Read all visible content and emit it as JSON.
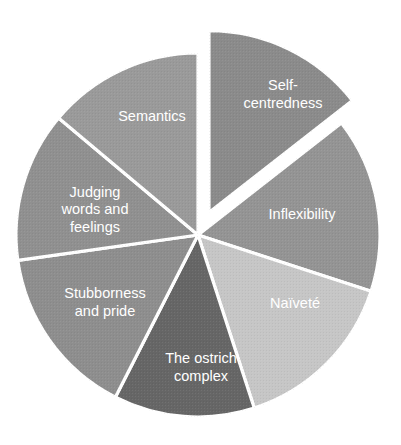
{
  "chart_data": {
    "type": "pie",
    "title": "",
    "subtitle": "",
    "xlabel": "",
    "ylabel": "",
    "legend_position": "none",
    "grid": false,
    "labels_inside_slices": true,
    "background_color": "#ffffff",
    "separator_color": "#ffffff",
    "label_text_color": "#ffffff",
    "start_angle_deg": 0,
    "direction": "clockwise",
    "center": {
      "x": 198,
      "y": 235
    },
    "radius": 182,
    "categories": [
      "Self-centredness",
      "Inflexibility",
      "Naïveté",
      "The ostrich complex",
      "Stubborness and pride",
      "Judging words and feelings",
      "Semantics"
    ],
    "values": [
      14.4,
      15.6,
      15.0,
      12.5,
      15.3,
      13.3,
      13.9
    ],
    "slices": [
      {
        "label": "Self-centredness",
        "label_lines": [
          "Self-",
          "centredness"
        ],
        "value": 14.4,
        "start_angle_deg": 0,
        "end_angle_deg": 52,
        "color": "#8b8b8b",
        "exploded": true,
        "explode_offset_px": 25,
        "label_x": 283,
        "label_y": 95
      },
      {
        "label": "Inflexibility",
        "label_lines": [
          "Inflexibility"
        ],
        "value": 15.6,
        "start_angle_deg": 52,
        "end_angle_deg": 108,
        "color": "#949494",
        "exploded": false,
        "explode_offset_px": 0,
        "label_x": 302,
        "label_y": 215
      },
      {
        "label": "Naïveté",
        "label_lines": [
          "Naïveté"
        ],
        "value": 15.0,
        "start_angle_deg": 108,
        "end_angle_deg": 162,
        "color": "#c6c6c6",
        "exploded": false,
        "explode_offset_px": 0,
        "label_x": 295,
        "label_y": 304
      },
      {
        "label": "The ostrich complex",
        "label_lines": [
          "The ostrich",
          "complex"
        ],
        "value": 12.5,
        "start_angle_deg": 162,
        "end_angle_deg": 207,
        "color": "#666666",
        "exploded": false,
        "explode_offset_px": 0,
        "label_x": 201,
        "label_y": 368
      },
      {
        "label": "Stubborness and pride",
        "label_lines": [
          "Stubborness",
          "and pride"
        ],
        "value": 15.3,
        "start_angle_deg": 207,
        "end_angle_deg": 262,
        "color": "#8e8e8e",
        "exploded": false,
        "explode_offset_px": 0,
        "label_x": 105,
        "label_y": 303
      },
      {
        "label": "Judging words and feelings",
        "label_lines": [
          "Judging",
          "words and",
          "feelings"
        ],
        "value": 13.3,
        "start_angle_deg": 262,
        "end_angle_deg": 310,
        "color": "#909090",
        "exploded": false,
        "explode_offset_px": 0,
        "label_x": 95,
        "label_y": 210
      },
      {
        "label": "Semantics",
        "label_lines": [
          "Semantics"
        ],
        "value": 13.9,
        "start_angle_deg": 310,
        "end_angle_deg": 360,
        "color": "#9a9a9a",
        "exploded": false,
        "explode_offset_px": 0,
        "label_x": 152,
        "label_y": 117
      }
    ]
  }
}
